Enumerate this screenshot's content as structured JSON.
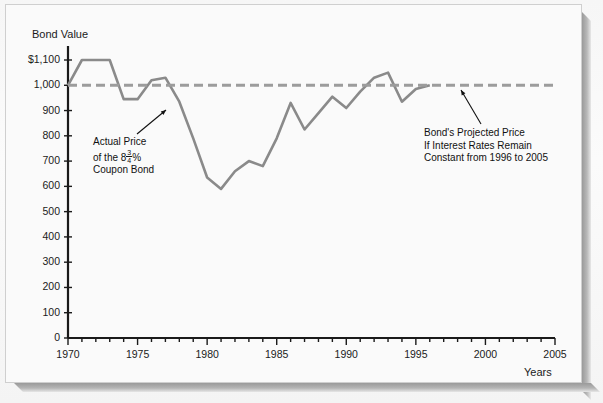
{
  "figure": {
    "y_axis_title": "Bond Value",
    "x_axis_title": "Years",
    "annotations": {
      "actual": {
        "line1": "Actual Price",
        "line2_prefix": "of the 8",
        "line2_num": "3",
        "line2_den": "4",
        "line2_suffix": "%",
        "line3": "Coupon Bond"
      },
      "projected": {
        "line1": "Bond's Projected Price",
        "line2": "If Interest Rates Remain",
        "line3": "Constant from 1996 to 2005"
      }
    },
    "colors": {
      "actual_line": "#8a8a8a",
      "projected_line": "#9c9c9c",
      "axis": "#1a1a1a",
      "text": "#1a1a1a",
      "paper": "#fafafa"
    }
  },
  "chart_data": {
    "type": "line",
    "title": "",
    "subtitle": "",
    "xlabel": "Years",
    "ylabel": "Bond Value",
    "xlim": [
      1970,
      2005
    ],
    "ylim": [
      0,
      1100
    ],
    "ytick_labels": [
      "0",
      "100",
      "200",
      "300",
      "400",
      "500",
      "600",
      "700",
      "800",
      "900",
      "1,000",
      "$1,100"
    ],
    "yticks": [
      0,
      100,
      200,
      300,
      400,
      500,
      600,
      700,
      800,
      900,
      1000,
      1100
    ],
    "xtick_labels": [
      "1970",
      "1975",
      "1980",
      "1985",
      "1990",
      "1995",
      "2000",
      "2005"
    ],
    "xticks": [
      1970,
      1975,
      1980,
      1985,
      1990,
      1995,
      2000,
      2005
    ],
    "minor_xtick_interval": 1,
    "grid": false,
    "legend": "none",
    "series": [
      {
        "name": "Actual Price of the 8 3/4% Coupon Bond",
        "style": "solid",
        "color": "#8a8a8a",
        "x": [
          1970,
          1971,
          1972,
          1973,
          1974,
          1975,
          1976,
          1977,
          1978,
          1979,
          1980,
          1981,
          1982,
          1983,
          1984,
          1985,
          1986,
          1987,
          1988,
          1989,
          1990,
          1991,
          1992,
          1993,
          1994,
          1995,
          1996
        ],
        "y": [
          1000,
          1100,
          1100,
          1100,
          945,
          945,
          1020,
          1030,
          935,
          790,
          635,
          590,
          660,
          700,
          680,
          790,
          930,
          825,
          890,
          955,
          910,
          975,
          1030,
          1050,
          935,
          985,
          1000
        ]
      },
      {
        "name": "Bond's Projected Price If Interest Rates Remain Constant from 1996 to 2005",
        "style": "dashed",
        "color": "#9c9c9c",
        "x": [
          1970,
          2005
        ],
        "y": [
          1000,
          1000
        ]
      }
    ],
    "annotations": [
      {
        "name": "actual-price-annotation",
        "text": "Actual Price of the 8 3/4% Coupon Bond",
        "points_to_x": 1977.5,
        "points_to_y": 900
      },
      {
        "name": "projected-price-annotation",
        "text": "Bond's Projected Price If Interest Rates Remain Constant from 1996 to 2005",
        "points_to_x": 1998,
        "points_to_y": 1000
      }
    ]
  }
}
